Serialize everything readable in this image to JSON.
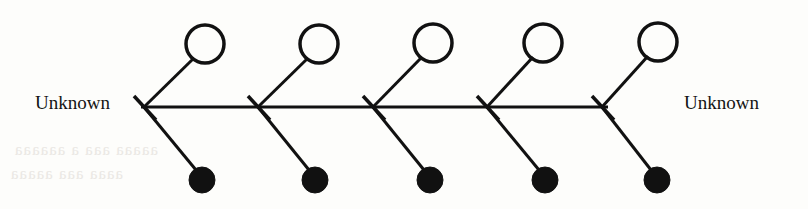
{
  "diagram": {
    "type": "pedigree-chart",
    "title": "",
    "labels": {
      "left_unknown": "Unknown",
      "right_unknown": "Unknown"
    },
    "stroke_color": "#111111",
    "background_color": "#fdfdfb",
    "spine": {
      "y": 107,
      "x_start": 141,
      "x_end": 608,
      "stroke_width": 3
    },
    "union_nodes": [
      {
        "id": "union-1",
        "x": 144,
        "y": 107,
        "symbol": "x-cross"
      },
      {
        "id": "union-2",
        "x": 258,
        "y": 107,
        "symbol": "x-cross"
      },
      {
        "id": "union-3",
        "x": 373,
        "y": 107,
        "symbol": "x-cross"
      },
      {
        "id": "union-4",
        "x": 487,
        "y": 107,
        "symbol": "x-cross"
      },
      {
        "id": "union-5",
        "x": 602,
        "y": 107,
        "symbol": "x-cross"
      }
    ],
    "open_circles": [
      {
        "id": "female-1",
        "cx": 205,
        "cy": 44,
        "r": 19,
        "fill": "none"
      },
      {
        "id": "female-2",
        "cx": 319,
        "cy": 44,
        "r": 19,
        "fill": "none"
      },
      {
        "id": "female-3",
        "cx": 433,
        "cy": 43,
        "r": 19,
        "fill": "none"
      },
      {
        "id": "female-4",
        "cx": 543,
        "cy": 43,
        "r": 19,
        "fill": "none"
      },
      {
        "id": "female-5",
        "cx": 658,
        "cy": 42,
        "r": 19,
        "fill": "none"
      }
    ],
    "filled_circles": [
      {
        "id": "affected-1",
        "cx": 202,
        "cy": 180,
        "r": 13,
        "fill": "#111111"
      },
      {
        "id": "affected-2",
        "cx": 315,
        "cy": 180,
        "r": 13,
        "fill": "#111111"
      },
      {
        "id": "affected-3",
        "cx": 430,
        "cy": 180,
        "r": 13,
        "fill": "#111111"
      },
      {
        "id": "affected-4",
        "cx": 545,
        "cy": 180,
        "r": 13,
        "fill": "#111111"
      },
      {
        "id": "affected-5",
        "cx": 657,
        "cy": 180,
        "r": 13,
        "fill": "#111111"
      }
    ],
    "bleed_through_text": [
      "aaaaa aaa a aaaaaa",
      "aaaa aaa aaaaa"
    ]
  }
}
